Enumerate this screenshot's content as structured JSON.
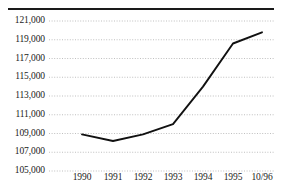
{
  "chart_data": {
    "type": "line",
    "title": "",
    "subtitle": "",
    "xlabel": "",
    "ylabel": "",
    "categories": [
      "1990",
      "1991",
      "1992",
      "1993",
      "1994",
      "1995",
      "10/96"
    ],
    "values": [
      108900,
      108200,
      108900,
      110000,
      114000,
      118600,
      119800
    ],
    "series": [
      {
        "name": "",
        "values": [
          108900,
          108200,
          108900,
          110000,
          114000,
          118600,
          119800
        ]
      }
    ],
    "ylim": [
      105000,
      121000
    ],
    "ytick_values": [
      105000,
      107000,
      109000,
      111000,
      113000,
      115000,
      117000,
      119000,
      121000
    ],
    "ytick_labels": [
      "105,000",
      "107,000",
      "109,000",
      "111,000",
      "113,000",
      "115,000",
      "117,000",
      "119,000",
      "121,000"
    ],
    "xtick_labels": [
      "1990",
      "1991",
      "1992",
      "1993",
      "1994",
      "1995",
      "10/96"
    ],
    "grid": true,
    "grid_axis": "y",
    "grid_style": "dotted",
    "legend": false,
    "legend_position": "none",
    "line_color": "#111111",
    "grid_color": "#b8b8b8",
    "rule_color": "#1a1a1a",
    "background_color": "#ffffff",
    "annotations": []
  },
  "axis": {
    "y_labels": [
      {
        "text": "121,000",
        "value": 121000
      },
      {
        "text": "119,000",
        "value": 119000
      },
      {
        "text": "117,000",
        "value": 117000
      },
      {
        "text": "115,000",
        "value": 115000
      },
      {
        "text": "113,000",
        "value": 113000
      },
      {
        "text": "111,000",
        "value": 111000
      },
      {
        "text": "109,000",
        "value": 109000
      },
      {
        "text": "107,000",
        "value": 107000
      },
      {
        "text": "105,000",
        "value": 105000
      }
    ],
    "x_labels": [
      {
        "text": "1990"
      },
      {
        "text": "1991"
      },
      {
        "text": "1992"
      },
      {
        "text": "1993"
      },
      {
        "text": "1994"
      },
      {
        "text": "1995"
      },
      {
        "text": "10/96"
      }
    ]
  }
}
